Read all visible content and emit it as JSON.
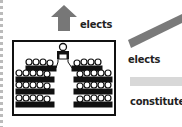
{
  "labels": {
    "top_elects": "elects",
    "right_elects": "elects",
    "constitute": "constitute"
  },
  "icons": {
    "up_arrow": "up-arrow-icon",
    "chamber": "parliament-chamber-icon"
  },
  "colors": {
    "arrow": "#777777",
    "diagonal_bar": "#7a7a7a",
    "light_bar": "#d8d8d8",
    "text": "#222222",
    "seats": "#111111"
  }
}
